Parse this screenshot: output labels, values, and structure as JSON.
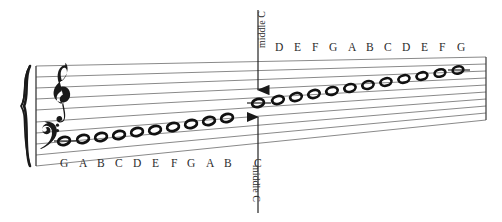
{
  "figure": {
    "kind": "grand-staff-perspective-diagram",
    "background_color": "#ffffff",
    "staff_line_color": "#8a8a8a",
    "ink_color": "#1a1a1a"
  },
  "clefs": {
    "treble": "treble-clef",
    "bass": "bass-clef",
    "brace": "brace"
  },
  "labels": {
    "middle_c_top": "middle C",
    "middle_c_bottom": "middle C"
  },
  "bass_letters": [
    "G",
    "A",
    "B",
    "C",
    "D",
    "E",
    "F",
    "G",
    "A",
    "B"
  ],
  "treble_letters": [
    "D",
    "E",
    "F",
    "G",
    "A",
    "B",
    "C",
    "D",
    "E",
    "F",
    "G"
  ],
  "middle_c_letter": "C",
  "scale_notes": [
    {
      "letter": "G",
      "staff": "bass",
      "x": 64,
      "y": 141,
      "ledger": true
    },
    {
      "letter": "A",
      "staff": "bass",
      "x": 83,
      "y": 139,
      "ledger": false
    },
    {
      "letter": "B",
      "staff": "bass",
      "x": 101,
      "y": 137,
      "ledger": false
    },
    {
      "letter": "C",
      "staff": "bass",
      "x": 119,
      "y": 135,
      "ledger": false
    },
    {
      "letter": "D",
      "staff": "bass",
      "x": 137,
      "y": 132,
      "ledger": false
    },
    {
      "letter": "E",
      "staff": "bass",
      "x": 155,
      "y": 130,
      "ledger": false
    },
    {
      "letter": "F",
      "staff": "bass",
      "x": 173,
      "y": 127,
      "ledger": false
    },
    {
      "letter": "G",
      "staff": "bass",
      "x": 191,
      "y": 124,
      "ledger": false
    },
    {
      "letter": "A",
      "staff": "bass",
      "x": 209,
      "y": 121,
      "ledger": false
    },
    {
      "letter": "B",
      "staff": "bass",
      "x": 227,
      "y": 118,
      "ledger": false
    },
    {
      "letter": "C",
      "staff": "middle",
      "x": 258,
      "y": 103,
      "ledger": true
    },
    {
      "letter": "D",
      "staff": "treble",
      "x": 278,
      "y": 100,
      "ledger": false
    },
    {
      "letter": "E",
      "staff": "treble",
      "x": 296,
      "y": 97,
      "ledger": false
    },
    {
      "letter": "F",
      "staff": "treble",
      "x": 314,
      "y": 94,
      "ledger": false
    },
    {
      "letter": "G",
      "staff": "treble",
      "x": 332,
      "y": 91,
      "ledger": false
    },
    {
      "letter": "A",
      "staff": "treble",
      "x": 350,
      "y": 88,
      "ledger": false
    },
    {
      "letter": "B",
      "staff": "treble",
      "x": 368,
      "y": 85,
      "ledger": false
    },
    {
      "letter": "C",
      "staff": "treble",
      "x": 386,
      "y": 82,
      "ledger": false
    },
    {
      "letter": "D",
      "staff": "treble",
      "x": 404,
      "y": 79,
      "ledger": false
    },
    {
      "letter": "E",
      "staff": "treble",
      "x": 422,
      "y": 76,
      "ledger": false
    },
    {
      "letter": "F",
      "staff": "treble",
      "x": 440,
      "y": 73,
      "ledger": false
    },
    {
      "letter": "G",
      "staff": "treble",
      "x": 458,
      "y": 70,
      "ledger": true
    }
  ]
}
